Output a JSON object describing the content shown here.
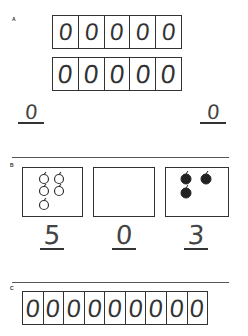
{
  "section_a": {
    "label": "A",
    "row1": {
      "digits": [
        "0",
        "0",
        "0",
        "0",
        "0"
      ]
    },
    "row2": {
      "digits": [
        "0",
        "0",
        "0",
        "0",
        "0"
      ]
    },
    "answers": [
      {
        "value": "0"
      },
      {
        "value": "0"
      }
    ]
  },
  "section_b": {
    "label": "B",
    "boxes": [
      {
        "apples": 5,
        "style": "outline",
        "answer": "5"
      },
      {
        "apples": 0,
        "style": "empty",
        "answer": "0"
      },
      {
        "apples": 3,
        "style": "filled",
        "answer": "3"
      }
    ]
  },
  "section_c": {
    "label": "C",
    "digits": [
      "0",
      "0",
      "0",
      "0",
      "0",
      "0",
      "0",
      "0",
      "0"
    ]
  }
}
